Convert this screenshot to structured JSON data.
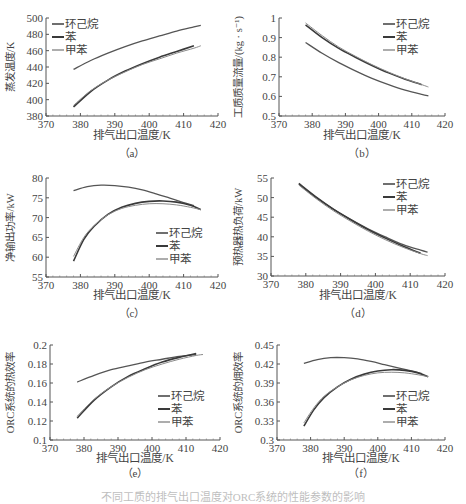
{
  "figure": {
    "caption": "不同工质的排气出口温度对ORC系统的性能参数的影响"
  },
  "series_meta": [
    {
      "name": "环己烷",
      "color": "#555555",
      "width": 1.3
    },
    {
      "name": "苯",
      "color": "#3a3a3a",
      "width": 1.6
    },
    {
      "name": "甲苯",
      "color": "#8a8a8a",
      "width": 1.0
    }
  ],
  "chart_data": [
    {
      "id": "a",
      "label": "（a）",
      "type": "line",
      "title": "",
      "xlabel": "排气出口温度/K",
      "ylabel": "蒸发温度/K",
      "xlim": [
        370,
        420
      ],
      "ylim": [
        380,
        500
      ],
      "xticks": [
        370,
        380,
        390,
        400,
        410,
        420
      ],
      "yticks": [
        380,
        400,
        420,
        440,
        460,
        480,
        500
      ],
      "ytick_labels": [
        "380",
        "400",
        "420",
        "440",
        "460",
        "480",
        "500"
      ],
      "legend_position": "upper-left",
      "grid": false,
      "series": [
        {
          "name": "环己烷",
          "x": [
            378,
            383,
            388,
            393,
            398,
            403,
            408,
            413,
            415
          ],
          "y": [
            437,
            448,
            457,
            465,
            472,
            478,
            484,
            489,
            491
          ]
        },
        {
          "name": "苯",
          "x": [
            378,
            383,
            388,
            393,
            398,
            403,
            408,
            413
          ],
          "y": [
            391,
            410,
            424,
            435,
            444,
            452,
            459,
            466
          ]
        },
        {
          "name": "甲苯",
          "x": [
            378,
            383,
            388,
            393,
            398,
            403,
            408,
            413,
            415
          ],
          "y": [
            393,
            411,
            424,
            434,
            443,
            450,
            457,
            463,
            466
          ]
        }
      ]
    },
    {
      "id": "b",
      "label": "（b）",
      "type": "line",
      "title": "",
      "xlabel": "排气出口温度/K",
      "ylabel": "工质质量流量/(kg · s⁻¹)",
      "xlim": [
        370,
        420
      ],
      "ylim": [
        0.5,
        1.0
      ],
      "xticks": [
        370,
        380,
        390,
        400,
        410,
        420
      ],
      "yticks": [
        0.5,
        0.6,
        0.7,
        0.8,
        0.9,
        1.0
      ],
      "ytick_labels": [
        "0.5",
        "0.6",
        "0.7",
        "0.8",
        "0.9",
        "1"
      ],
      "legend_position": "upper-right",
      "grid": false,
      "series": [
        {
          "name": "环己烷",
          "x": [
            378,
            383,
            388,
            393,
            398,
            403,
            408,
            413,
            415
          ],
          "y": [
            0.875,
            0.82,
            0.772,
            0.73,
            0.692,
            0.66,
            0.632,
            0.61,
            0.603
          ]
        },
        {
          "name": "苯",
          "x": [
            378,
            383,
            388,
            393,
            398,
            403,
            408,
            413
          ],
          "y": [
            0.965,
            0.9,
            0.845,
            0.8,
            0.758,
            0.72,
            0.688,
            0.66
          ]
        },
        {
          "name": "甲苯",
          "x": [
            378,
            383,
            388,
            393,
            398,
            403,
            408,
            413,
            415
          ],
          "y": [
            0.975,
            0.91,
            0.852,
            0.805,
            0.762,
            0.724,
            0.69,
            0.66,
            0.648
          ]
        }
      ]
    },
    {
      "id": "c",
      "label": "（c）",
      "type": "line",
      "title": "",
      "xlabel": "排气出口温度/K",
      "ylabel": "净输出功率/kW",
      "xlim": [
        370,
        420
      ],
      "ylim": [
        55,
        80
      ],
      "xticks": [
        370,
        380,
        390,
        400,
        410,
        420
      ],
      "yticks": [
        55,
        60,
        65,
        70,
        75,
        80
      ],
      "ytick_labels": [
        "55",
        "60",
        "65",
        "70",
        "75",
        "80"
      ],
      "legend_position": "lower-right",
      "grid": false,
      "series": [
        {
          "name": "环己烷",
          "x": [
            378,
            382,
            386,
            390,
            394,
            398,
            402,
            406,
            410,
            413
          ],
          "y": [
            76.8,
            77.8,
            78.2,
            78.1,
            77.7,
            77.0,
            76.0,
            74.9,
            73.8,
            73.0
          ]
        },
        {
          "name": "苯",
          "x": [
            378,
            381,
            384,
            388,
            392,
            396,
            400,
            404,
            408,
            412,
            415
          ],
          "y": [
            59.0,
            64.5,
            67.8,
            70.8,
            72.6,
            73.6,
            74.1,
            74.2,
            73.9,
            73.1,
            72.0
          ]
        },
        {
          "name": "甲苯",
          "x": [
            378,
            381,
            384,
            388,
            392,
            396,
            400,
            404,
            408,
            412,
            415
          ],
          "y": [
            60.2,
            65.0,
            68.0,
            70.7,
            72.3,
            73.1,
            73.5,
            73.5,
            73.2,
            72.6,
            72.0
          ]
        }
      ]
    },
    {
      "id": "d",
      "label": "（d）",
      "type": "line",
      "title": "",
      "xlabel": "排气出口温度/K",
      "ylabel": "预热器热负荷/kW",
      "xlim": [
        370,
        420
      ],
      "ylim": [
        30,
        55
      ],
      "xticks": [
        370,
        380,
        390,
        400,
        410,
        420
      ],
      "yticks": [
        30,
        35,
        40,
        45,
        50,
        55
      ],
      "ytick_labels": [
        "30",
        "35",
        "40",
        "45",
        "50",
        "55"
      ],
      "legend_position": "upper-right",
      "grid": false,
      "series": [
        {
          "name": "环己烷",
          "x": [
            378,
            383,
            388,
            393,
            398,
            403,
            408,
            413,
            415
          ],
          "y": [
            53.4,
            50.0,
            47.0,
            44.4,
            42.0,
            39.9,
            38.0,
            36.6,
            36.1
          ]
        },
        {
          "name": "苯",
          "x": [
            378,
            383,
            388,
            393,
            398,
            403,
            408,
            413
          ],
          "y": [
            53.6,
            50.1,
            47.0,
            44.3,
            41.8,
            39.6,
            37.6,
            35.8
          ]
        },
        {
          "name": "甲苯",
          "x": [
            378,
            383,
            388,
            393,
            398,
            403,
            408,
            413,
            415
          ],
          "y": [
            53.2,
            49.7,
            46.6,
            43.9,
            41.4,
            39.2,
            37.3,
            35.7,
            35.2
          ]
        }
      ]
    },
    {
      "id": "e",
      "label": "（e）",
      "type": "line",
      "title": "",
      "xlabel": "排气出口温度/K",
      "ylabel": "ORC系统的热效率",
      "xlim": [
        370,
        420
      ],
      "ylim": [
        0.1,
        0.2
      ],
      "xticks": [
        370,
        380,
        390,
        400,
        410,
        420
      ],
      "yticks": [
        0.1,
        0.12,
        0.14,
        0.16,
        0.18,
        0.2
      ],
      "ytick_labels": [
        "0.1",
        "0.12",
        "0.14",
        "0.16",
        "0.18",
        "0.2"
      ],
      "legend_position": "lower-right",
      "grid": false,
      "series": [
        {
          "name": "环己烷",
          "x": [
            378,
            383,
            388,
            393,
            398,
            403,
            408,
            413
          ],
          "y": [
            0.161,
            0.168,
            0.174,
            0.178,
            0.182,
            0.185,
            0.188,
            0.19
          ]
        },
        {
          "name": "苯",
          "x": [
            378,
            383,
            388,
            393,
            398,
            403,
            408,
            413
          ],
          "y": [
            0.123,
            0.142,
            0.156,
            0.167,
            0.175,
            0.182,
            0.187,
            0.191
          ]
        },
        {
          "name": "甲苯",
          "x": [
            378,
            383,
            388,
            393,
            398,
            403,
            408,
            413,
            415
          ],
          "y": [
            0.125,
            0.143,
            0.156,
            0.166,
            0.174,
            0.18,
            0.185,
            0.189,
            0.19
          ]
        }
      ]
    },
    {
      "id": "f",
      "label": "（f）",
      "type": "line",
      "title": "",
      "xlabel": "排气出口温度/K",
      "ylabel": "ORC系统的㶲效率",
      "xlim": [
        370,
        420
      ],
      "ylim": [
        0.3,
        0.45
      ],
      "xticks": [
        370,
        380,
        390,
        400,
        410,
        420
      ],
      "yticks": [
        0.3,
        0.33,
        0.36,
        0.39,
        0.42,
        0.45
      ],
      "ytick_labels": [
        "0.3",
        "0.33",
        "0.36",
        "0.39",
        "0.42",
        "0.45"
      ],
      "legend_position": "lower-right",
      "grid": false,
      "series": [
        {
          "name": "环己烷",
          "x": [
            378,
            382,
            386,
            390,
            394,
            398,
            402,
            406,
            410,
            413
          ],
          "y": [
            0.421,
            0.427,
            0.43,
            0.43,
            0.428,
            0.424,
            0.419,
            0.414,
            0.409,
            0.405
          ]
        },
        {
          "name": "苯",
          "x": [
            378,
            381,
            384,
            388,
            392,
            396,
            400,
            404,
            408,
            412,
            415
          ],
          "y": [
            0.322,
            0.348,
            0.367,
            0.384,
            0.396,
            0.404,
            0.409,
            0.411,
            0.41,
            0.406,
            0.4
          ]
        },
        {
          "name": "甲苯",
          "x": [
            378,
            381,
            384,
            388,
            392,
            396,
            400,
            404,
            408,
            412,
            415
          ],
          "y": [
            0.327,
            0.351,
            0.369,
            0.384,
            0.395,
            0.402,
            0.406,
            0.407,
            0.406,
            0.403,
            0.4
          ]
        }
      ]
    }
  ]
}
